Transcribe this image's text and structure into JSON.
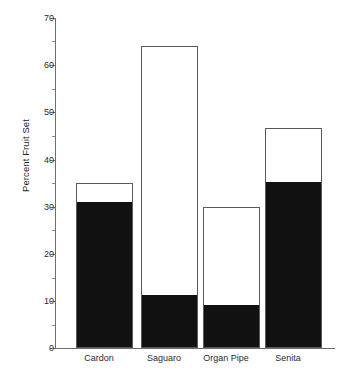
{
  "chart_data": {
    "type": "bar",
    "title": "",
    "subtitle": "",
    "xlabel": "",
    "ylabel": "Percent Fruit Set",
    "categories": [
      "Cardon",
      "Saguaro",
      "Organ Pipe",
      "Senita"
    ],
    "ylim": [
      0,
      70
    ],
    "y_ticks": [
      0,
      10,
      20,
      30,
      40,
      50,
      60,
      70
    ],
    "y_minor_ticks": [
      5,
      15,
      25,
      35,
      45,
      55,
      65
    ],
    "grid": false,
    "legend": null,
    "stacked": true,
    "series": [
      {
        "name": "filled",
        "color": "#111111",
        "values": [
          30.7,
          11.0,
          9.0,
          35.0
        ]
      },
      {
        "name": "open",
        "color": "#ffffff",
        "values": [
          35.0,
          64.0,
          30.0,
          46.7
        ]
      }
    ],
    "bar_totals": [
      35.0,
      64.0,
      30.0,
      46.7
    ]
  },
  "axis": {
    "y_title": "Percent Fruit Set",
    "tick_labels": [
      "70",
      "60",
      "50",
      "40",
      "30",
      "20",
      "10",
      "0"
    ]
  },
  "colors": {
    "bar_fill": "#111111",
    "bar_open": "#ffffff",
    "bar_outline": "#5a5a5a",
    "axis": "#6e6e6e",
    "text": "#2b2b2b",
    "background": "#ffffff"
  }
}
